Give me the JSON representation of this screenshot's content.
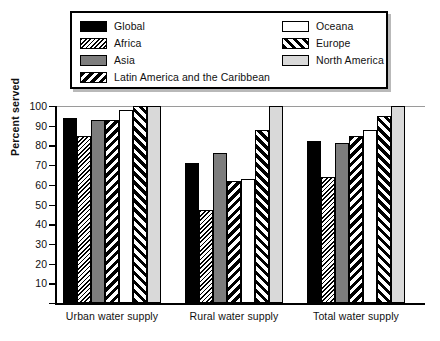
{
  "legend": {
    "left_items": [
      {
        "label": "Global",
        "pattern": "p-global",
        "key": "global"
      },
      {
        "label": "Africa",
        "pattern": "p-africa",
        "key": "africa"
      },
      {
        "label": "Asia",
        "pattern": "p-asia",
        "key": "asia"
      },
      {
        "label": "Latin America and the Caribbean",
        "pattern": "p-latin",
        "key": "latin"
      }
    ],
    "right_items": [
      {
        "label": "Oceana",
        "pattern": "p-oceana",
        "key": "oceana"
      },
      {
        "label": "Europe",
        "pattern": "p-europe",
        "key": "europe"
      },
      {
        "label": "North America",
        "pattern": "p-north",
        "key": "north"
      }
    ]
  },
  "chart_data": {
    "type": "bar",
    "title": "",
    "xlabel": "",
    "ylabel": "Percent served",
    "ylim": [
      0,
      100
    ],
    "yticks": [
      0,
      10,
      20,
      30,
      40,
      50,
      60,
      70,
      80,
      90,
      100
    ],
    "grid": false,
    "legend_position": "top",
    "categories": [
      "Urban water supply",
      "Rural water supply",
      "Total water supply"
    ],
    "series": [
      {
        "name": "Global",
        "pattern": "p-global",
        "values": [
          94,
          71,
          82
        ]
      },
      {
        "name": "Africa",
        "pattern": "p-africa",
        "values": [
          85,
          47,
          64
        ]
      },
      {
        "name": "Asia",
        "pattern": "p-asia",
        "values": [
          93,
          76,
          81
        ]
      },
      {
        "name": "Latin America and the Caribbean",
        "pattern": "p-latin",
        "values": [
          93,
          62,
          85
        ]
      },
      {
        "name": "Oceana",
        "pattern": "p-oceana",
        "values": [
          98,
          63,
          88
        ]
      },
      {
        "name": "Europe",
        "pattern": "p-europe",
        "values": [
          100,
          88,
          95
        ]
      },
      {
        "name": "North America",
        "pattern": "p-north",
        "values": [
          100,
          100,
          100
        ]
      }
    ]
  }
}
